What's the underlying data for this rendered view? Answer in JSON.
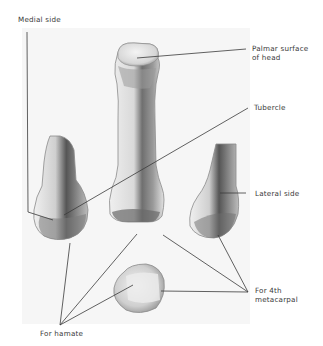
{
  "figure": {
    "labels": {
      "medial_side": "Medial side",
      "palmar_surface_line1": "Palmar surface",
      "palmar_surface_line2": "of head",
      "tubercle": "Tubercle",
      "lateral_side": "Lateral side",
      "for_4th_line1": "For 4th",
      "for_4th_line2": "metacarpal",
      "for_hamate": "For hamate"
    },
    "colors": {
      "background": "#ffffff",
      "plate": "#f6f6f6",
      "bone_light": "#e8e8e8",
      "bone_shadow": "#6e6e6e",
      "leader_line": "#3a3a3a",
      "text": "#3a3a3a"
    }
  }
}
